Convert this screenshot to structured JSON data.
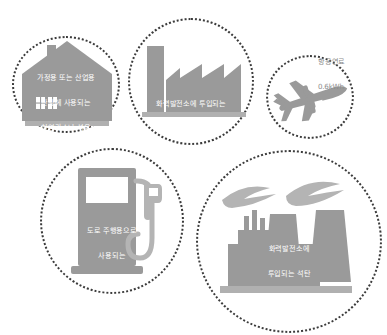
{
  "infographic": {
    "colors": {
      "icon_fill": "#9a9a9a",
      "icon_fill_light": "#b4b4b4",
      "dot_color": "#3b3b3b",
      "caption_on_icon": "#ffffff",
      "caption_outside": "#8d8d8d",
      "background": "#ffffff"
    },
    "items": [
      {
        "id": "house",
        "icon": "house-icon",
        "lines": [
          "가정용 또는 산업용",
          "난방에 사용되는",
          "천연가스나 석유"
        ],
        "value": "1kWh",
        "caption_inside": true
      },
      {
        "id": "factory",
        "icon": "factory-icon",
        "lines": [
          "화력발전소에 투입되는",
          "천연가스"
        ],
        "value": "1.7kWh",
        "caption_inside": true
      },
      {
        "id": "plane",
        "icon": "airplane-icon",
        "lines": [
          "항공연료"
        ],
        "value": "0.6kWh",
        "caption_inside": false
      },
      {
        "id": "pump",
        "icon": "fuel-pump-icon",
        "lines": [
          "도로 주행용으로",
          "사용되는",
          "휘발유나 경유"
        ],
        "value": "2.5kWh",
        "caption_inside": true
      },
      {
        "id": "coal",
        "icon": "coal-power-plant-icon",
        "lines": [
          "화력발전소에",
          "투입되는 석탄"
        ],
        "value": "2.6kWh",
        "caption_inside": true
      }
    ]
  }
}
